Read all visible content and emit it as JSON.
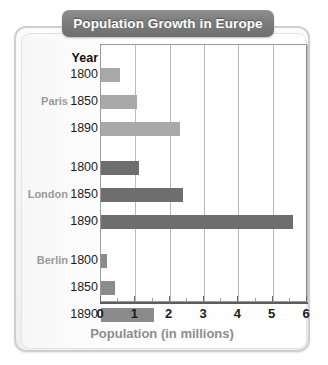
{
  "chart_data": {
    "type": "bar",
    "orientation": "horizontal",
    "title": "Population Growth in Europe",
    "xlabel": "Population (in millions)",
    "ylabel": "Year",
    "year_header": "Year",
    "xlim": [
      0,
      6
    ],
    "xticks": [
      0,
      1,
      2,
      3,
      4,
      5,
      6
    ],
    "xtick_labels": [
      "0",
      "1",
      "2",
      "3",
      "4",
      "5",
      "6"
    ],
    "minor_tick_step": 0.5,
    "grid": true,
    "legend": "none",
    "groups": [
      {
        "name": "Paris",
        "color": "#a9a9a9",
        "categories": [
          "1800",
          "1850",
          "1890"
        ],
        "values": [
          0.55,
          1.05,
          2.3
        ]
      },
      {
        "name": "London",
        "color": "#6e6e6e",
        "categories": [
          "1800",
          "1850",
          "1890"
        ],
        "values": [
          1.1,
          2.4,
          5.6
        ]
      },
      {
        "name": "Berlin",
        "color": "#8b8b8b",
        "categories": [
          "1800",
          "1850",
          "1890"
        ],
        "values": [
          0.17,
          0.42,
          1.55
        ]
      }
    ]
  },
  "style": {
    "banner_color": "#7c7c7c",
    "banner_text_color": "#ffffff",
    "panel_border": "#cfcfcf",
    "city_label_color": "#9a9a9a",
    "year_label_color": "#1c1c1c",
    "axis_title_color": "#8d8d8d",
    "gridline_color": "#b9b9b9"
  }
}
